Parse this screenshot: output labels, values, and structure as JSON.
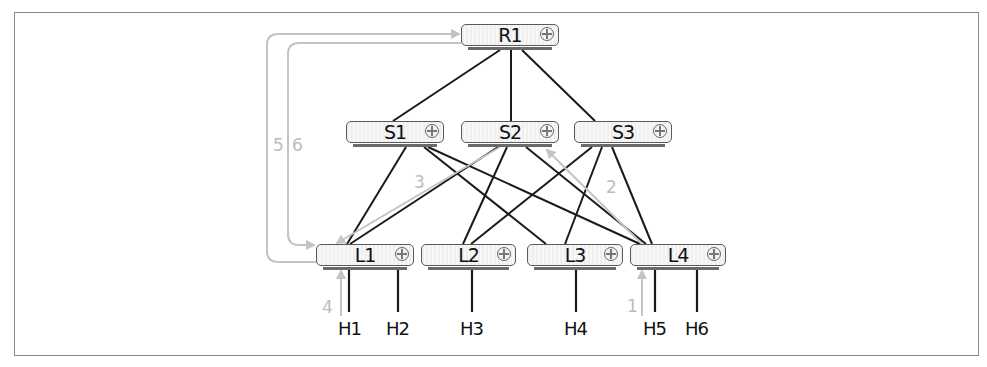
{
  "diagram": {
    "type": "leaf-spine network topology with packet path",
    "colors": {
      "link": "#1a1a1a",
      "path": "#c4c4c4",
      "frame": "#8a8a8a",
      "node_border": "#5a5a5a"
    },
    "nodes": {
      "R1": {
        "label": "R1",
        "tier": "root",
        "icon": "router-icon"
      },
      "S1": {
        "label": "S1",
        "tier": "spine",
        "icon": "router-icon"
      },
      "S2": {
        "label": "S2",
        "tier": "spine",
        "icon": "router-icon"
      },
      "S3": {
        "label": "S3",
        "tier": "spine",
        "icon": "router-icon"
      },
      "L1": {
        "label": "L1",
        "tier": "leaf",
        "icon": "router-icon"
      },
      "L2": {
        "label": "L2",
        "tier": "leaf",
        "icon": "router-icon"
      },
      "L3": {
        "label": "L3",
        "tier": "leaf",
        "icon": "router-icon"
      },
      "L4": {
        "label": "L4",
        "tier": "leaf",
        "icon": "router-icon"
      }
    },
    "hosts": {
      "H1": {
        "label": "H1",
        "attached_to": "L1"
      },
      "H2": {
        "label": "H2",
        "attached_to": "L1"
      },
      "H3": {
        "label": "H3",
        "attached_to": "L2"
      },
      "H4": {
        "label": "H4",
        "attached_to": "L3"
      },
      "H5": {
        "label": "H5",
        "attached_to": "L4"
      },
      "H6": {
        "label": "H6",
        "attached_to": "L4"
      }
    },
    "links": [
      [
        "R1",
        "S1"
      ],
      [
        "R1",
        "S2"
      ],
      [
        "R1",
        "S3"
      ],
      [
        "S1",
        "L1"
      ],
      [
        "S1",
        "L2"
      ],
      [
        "S1",
        "L3"
      ],
      [
        "S1",
        "L4"
      ],
      [
        "S2",
        "L1"
      ],
      [
        "S2",
        "L2"
      ],
      [
        "S2",
        "L3"
      ],
      [
        "S2",
        "L4"
      ],
      [
        "S3",
        "L1"
      ],
      [
        "S3",
        "L2"
      ],
      [
        "S3",
        "L3"
      ],
      [
        "S3",
        "L4"
      ]
    ],
    "path_steps": {
      "s1": {
        "label": "1",
        "from": "H5",
        "to": "L4"
      },
      "s2": {
        "label": "2",
        "from": "L4",
        "to": "S2"
      },
      "s3": {
        "label": "3",
        "from": "S2",
        "to": "L1"
      },
      "s4": {
        "label": "4",
        "from": "H1",
        "to": "L1"
      },
      "s5": {
        "label": "5",
        "from": "L1",
        "to": "R1"
      },
      "s6": {
        "label": "6",
        "from": "R1",
        "to": "L1"
      }
    }
  }
}
